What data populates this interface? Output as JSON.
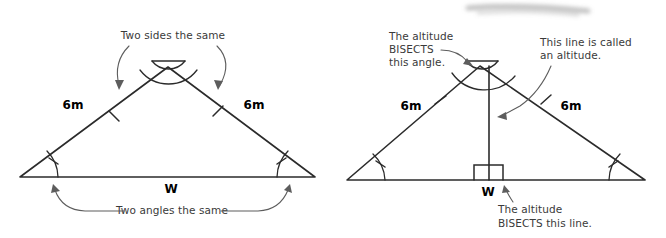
{
  "figure": {
    "background_color": "#ffffff",
    "ink_color": "#2b2b2b",
    "annotation_color": "#5d5d5d"
  },
  "left_diagram": {
    "name": "isosceles-triangle-sides-angles",
    "labels": {
      "left_side": "6m",
      "right_side": "6m",
      "base": "W"
    },
    "annotations": {
      "top": "Two sides the same",
      "bottom": "Two angles the same"
    },
    "marks": {
      "apex": "double-arc-angle-mark",
      "sides": "single-tick",
      "base_angles": "single-arc-with-tick"
    }
  },
  "right_diagram": {
    "name": "isosceles-triangle-altitude",
    "labels": {
      "left_side": "6m",
      "right_side": "6m",
      "base": "W"
    },
    "annotations": {
      "top_left_line1": "The altitude",
      "top_left_line2": "BISECTS",
      "top_left_line3": "this angle.",
      "top_right_line1": "This line is called",
      "top_right_line2": "an altitude.",
      "bottom_line1": "The altitude",
      "bottom_line2": "BISECTS this line."
    },
    "marks": {
      "apex": "double-arc-angle-mark",
      "sides": "single-tick",
      "base_angles": "single-arc-with-tick",
      "foot": "right-angle-square",
      "altitude": "vertical-line"
    }
  },
  "artifact": {
    "name": "page-scan-smudge",
    "description": "gray blurred streak at top"
  }
}
